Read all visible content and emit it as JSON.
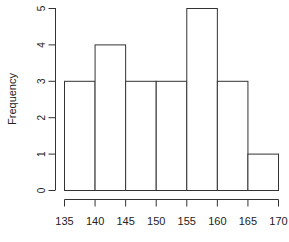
{
  "chart_data": {
    "type": "bar",
    "subtype": "histogram",
    "title": "",
    "xlabel": "",
    "ylabel": "Frequency",
    "bin_edges": [
      135,
      140,
      145,
      150,
      155,
      160,
      165,
      170
    ],
    "categories": [
      "135-140",
      "140-145",
      "145-150",
      "150-155",
      "155-160",
      "160-165",
      "165-170"
    ],
    "values": [
      3,
      4,
      3,
      3,
      5,
      3,
      1
    ],
    "xlim": [
      135,
      170
    ],
    "ylim": [
      0,
      5
    ],
    "x_ticks": [
      135,
      140,
      145,
      150,
      155,
      160,
      165,
      170
    ],
    "y_ticks": [
      0,
      1,
      2,
      3,
      4,
      5
    ],
    "grid": false,
    "legend": null,
    "colors": {
      "bar_fill": "#ffffff",
      "bar_stroke": "#333333",
      "axis": "#333333"
    }
  }
}
